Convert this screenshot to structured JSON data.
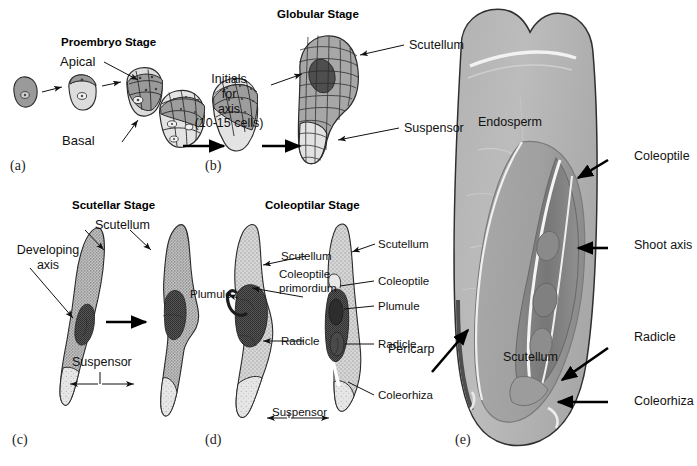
{
  "figure": {
    "kind": "botanical-diagram",
    "background_color": "#ffffff",
    "ink_color": "#111111"
  },
  "panels": [
    {
      "id": "a",
      "letter": "(a)",
      "title": "Proembryo Stage",
      "labels": [
        "Apical",
        "Basal"
      ],
      "stages_shown": 3,
      "description": "Zygote dividing into two-celled then multicellular proembryo with apical and basal regions"
    },
    {
      "id": "b",
      "letter": "(b)",
      "title": "",
      "labels": [],
      "stages_shown": 2,
      "description": "Multicellular proembryo, cells differentiating"
    },
    {
      "id": "c",
      "letter": "(c)",
      "title": "Scutellar Stage",
      "labels": [
        "Scutellum",
        "Developing axis",
        "Suspensor"
      ],
      "stages_shown": 2,
      "description": "Elongated embryo with developing axis and suspensor"
    },
    {
      "id": "d",
      "letter": "(d)",
      "title": "Coleoptilar Stage",
      "labels": [
        "Scutellum",
        "Coleoptile primordium",
        "Plumule",
        "Radicle",
        "Suspensor",
        "Coleoptile",
        "Coleorhiza"
      ],
      "stages_shown": 2,
      "description": "Embryo with coleoptile primordium, plumule, radicle and coleorhiza"
    },
    {
      "id": "e",
      "letter": "(e)",
      "title": "",
      "labels": [
        "Endosperm",
        "Pericarp",
        "Scutellum",
        "Coleoptile",
        "Shoot axis",
        "Radicle",
        "Coleorhiza"
      ],
      "description": "Light micrograph, longitudinal section of mature maize kernel"
    }
  ],
  "panel_a": {
    "letter": "(a)",
    "title": "Proembryo Stage",
    "apical_label": "Apical",
    "basal_label": "Basal"
  },
  "panel_b": {
    "letter": "(b)"
  },
  "globular": {
    "title": "Globular Stage",
    "scutellum_label": "Scutellum",
    "suspensor_label": "Suspensor",
    "initials_line1": "Initials",
    "initials_line2": "for",
    "initials_line3": "axis",
    "initials_line4": "(10-15 cells)"
  },
  "panel_c": {
    "letter": "(c)",
    "title": "Scutellar Stage",
    "scutellum_label": "Scutellum",
    "developing_axis_line1": "Developing",
    "developing_axis_line2": "axis",
    "suspensor_label": "Suspensor"
  },
  "panel_d": {
    "letter": "(d)",
    "title": "Coleoptilar Stage",
    "scutellum_left_label": "Scutellum",
    "coleoptile_primordium_line1": "Coleoptile",
    "coleoptile_primordium_line2": "primordium",
    "plumule_left_label": "Plumule",
    "radicle_left_label": "Radicle",
    "suspensor_label": "Suspensor",
    "scutellum_right_label": "Scutellum",
    "coleoptile_label": "Coleoptile",
    "plumule_right_label": "Plumule",
    "radicle_right_label": "Radicle",
    "coleorhiza_label": "Coleorhiza"
  },
  "panel_e": {
    "letter": "(e)",
    "endosperm_label": "Endosperm",
    "pericarp_label": "Pericarp",
    "scutellum_label": "Scutellum",
    "coleoptile_label": "Coleoptile",
    "shoot_axis_label": "Shoot axis",
    "radicle_label": "Radicle",
    "coleorhiza_label": "Coleorhiza"
  },
  "colors": {
    "ink": "#111111",
    "cell_dark": "#8e8e8e",
    "cell_light": "#dcdcdc",
    "stipple_mid": "#b4b4b4",
    "stipple_dark": "#6a6a6a",
    "micrograph_light": "#b9b9b9",
    "micrograph_mid": "#9e9e9e",
    "micrograph_dark": "#6f6f6f",
    "micrograph_outline": "#3a3a3a"
  }
}
